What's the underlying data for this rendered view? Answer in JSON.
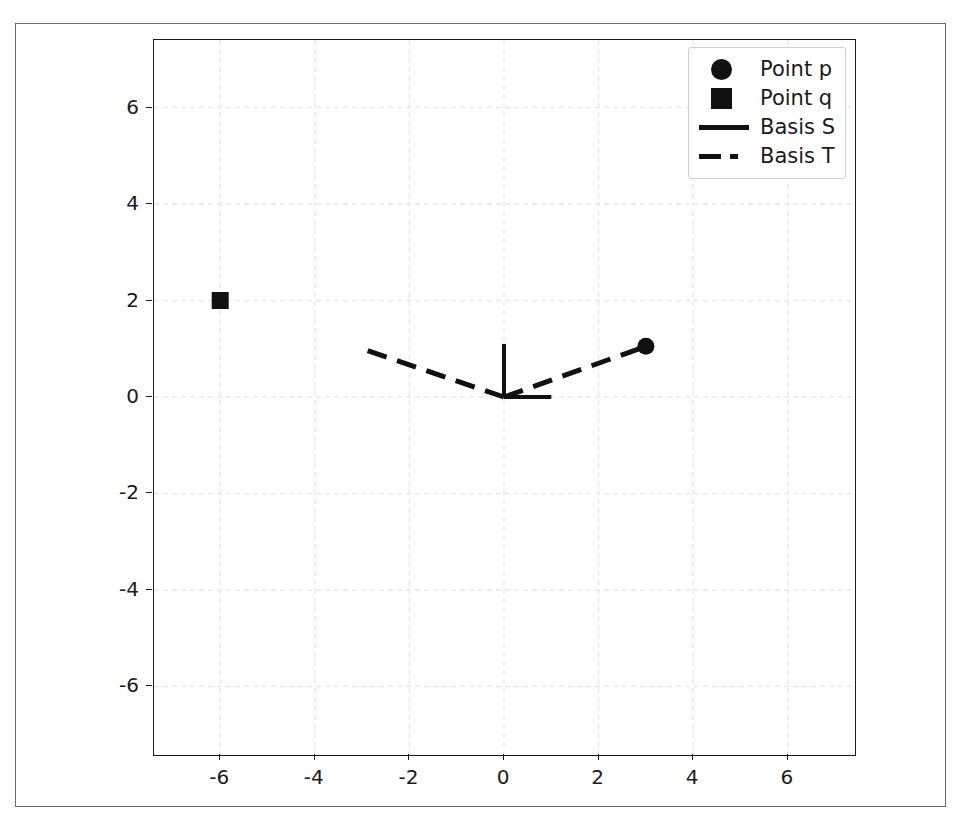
{
  "chart_data": {
    "type": "scatter",
    "title": "",
    "xlabel": "",
    "ylabel": "",
    "xlim": [
      -7.4,
      7.4
    ],
    "ylim": [
      -7.4,
      7.4
    ],
    "grid": true,
    "grid_style": "dashed",
    "grid_color": "#e8e8e8",
    "legend_position": "upper right",
    "xticks": [
      -6,
      -4,
      -2,
      0,
      2,
      4,
      6
    ],
    "yticks": [
      -6,
      -4,
      -2,
      0,
      2,
      4,
      6
    ],
    "xticklabels": [
      "-6",
      "-4",
      "-2",
      "0",
      "2",
      "4",
      "6"
    ],
    "yticklabels": [
      "-6",
      "-4",
      "-2",
      "0",
      "2",
      "4",
      "6"
    ],
    "series": [
      {
        "name": "Point p",
        "type": "scatter",
        "marker": "circle",
        "color": "#111111",
        "markersize": 17,
        "points": [
          {
            "x": 3.0,
            "y": 1.05
          }
        ]
      },
      {
        "name": "Point q",
        "type": "scatter",
        "marker": "square",
        "color": "#111111",
        "markersize": 17,
        "points": [
          {
            "x": -6.0,
            "y": 2.0
          }
        ]
      },
      {
        "name": "Basis S",
        "type": "line",
        "linestyle": "solid",
        "color": "#111111",
        "linewidth": 4,
        "vectors": [
          {
            "from": {
              "x": 0,
              "y": 0
            },
            "to": {
              "x": 0,
              "y": 1.1
            }
          },
          {
            "from": {
              "x": 0,
              "y": 0
            },
            "to": {
              "x": 1.0,
              "y": 0.0
            }
          }
        ]
      },
      {
        "name": "Basis T",
        "type": "line",
        "linestyle": "dashed",
        "color": "#111111",
        "linewidth": 5,
        "vectors": [
          {
            "from": {
              "x": 0,
              "y": 0
            },
            "to": {
              "x": -3.0,
              "y": 1.0
            }
          },
          {
            "from": {
              "x": 0,
              "y": 0
            },
            "to": {
              "x": 3.0,
              "y": 1.05
            }
          }
        ]
      }
    ]
  },
  "legend": {
    "entries": [
      {
        "label": "Point p",
        "key": "circle-marker-icon"
      },
      {
        "label": "Point q",
        "key": "square-marker-icon"
      },
      {
        "label": "Basis S",
        "key": "solid-line-icon"
      },
      {
        "label": "Basis T",
        "key": "dashed-line-icon"
      }
    ]
  }
}
